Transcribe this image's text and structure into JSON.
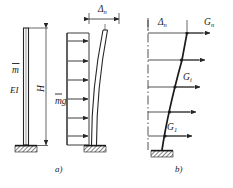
{
  "figure": {
    "type": "structural-engineering-diagram",
    "stroke_color": "#262626",
    "hatch_color": "#1a1a1a",
    "background": "#ffffff"
  },
  "captions": {
    "left": "a)",
    "right": "b)"
  },
  "panel_a": {
    "column": {
      "label_mass": "m",
      "label_mass_overbar": true,
      "label_stiffness": "EI",
      "label_height": "H"
    },
    "loaded": {
      "label_load": "mg",
      "label_load_overbar": true,
      "label_deflection": "Δ",
      "label_deflection_sub": "n",
      "load_arrow_count": 6,
      "load_direction": "horizontal-right",
      "support": "fixed-base"
    }
  },
  "panel_b": {
    "label_deflection": "Δ",
    "label_deflection_sub": "n",
    "support": "fixed-base",
    "reference_line": "dash-dot-vertical",
    "forces": [
      {
        "label": "G",
        "sub": "1",
        "show_label": true
      },
      {
        "label": "G",
        "sub": "",
        "show_label": false
      },
      {
        "label": "G",
        "sub": "i",
        "show_label": true
      },
      {
        "label": "G",
        "sub": "",
        "show_label": false
      },
      {
        "label": "G",
        "sub": "n",
        "show_label": true
      }
    ]
  }
}
